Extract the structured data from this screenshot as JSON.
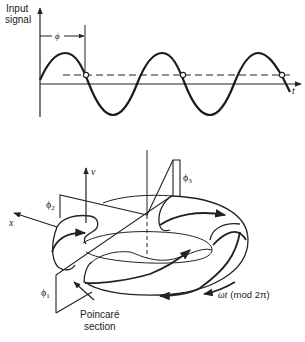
{
  "top_panel": {
    "y_axis_label_line1": "Input",
    "y_axis_label_line2": "signal",
    "x_axis_label": "t",
    "phase_label": "ϕ",
    "curve": "sinusoid",
    "sample_points": 3
  },
  "bottom_panel": {
    "v_axis_label": "v",
    "x_axis_label": "x",
    "phi1_label": "ϕ",
    "phi1_sub": "1",
    "phi2_label": "ϕ",
    "phi2_sub": "2",
    "phi3_label": "ϕ",
    "phi3_sub": "3",
    "section_label_line1": "Poincaré",
    "section_label_line2": "section",
    "rotation_label_omega_t": "ωt",
    "rotation_label_mod": "(mod 2π)"
  },
  "colors": {
    "ink": "#222222",
    "background": "#ffffff"
  }
}
